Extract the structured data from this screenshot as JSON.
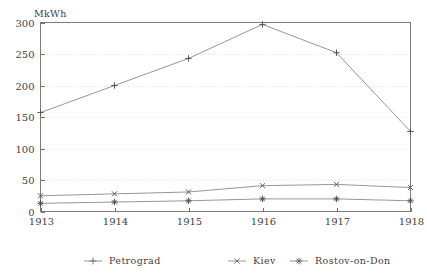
{
  "chart_data": {
    "type": "line",
    "title": "",
    "subtitle": "",
    "xlabel": "",
    "ylabel": "MkWh",
    "y_unit_label": "MkWh",
    "categories": [
      "1913",
      "1914",
      "1915",
      "1916",
      "1917",
      "1918"
    ],
    "x": [
      1913,
      1914,
      1915,
      1916,
      1917,
      1918
    ],
    "xlim": [
      1913,
      1918
    ],
    "ylim": [
      0,
      300
    ],
    "y_ticks": [
      0,
      50,
      100,
      150,
      200,
      250,
      300
    ],
    "y_tick_labels": [
      "0",
      "50",
      "100",
      "150",
      "200",
      "250",
      "300"
    ],
    "x_ticks": [
      1913,
      1914,
      1915,
      1916,
      1917,
      1918
    ],
    "x_tick_labels": [
      "1913",
      "1914",
      "1915",
      "1916",
      "1917",
      "1918"
    ],
    "grid": true,
    "grid_axis": "y",
    "legend_position": "bottom",
    "series": [
      {
        "name": "Petrograd",
        "marker": "plus",
        "values": [
          157,
          200,
          243,
          297,
          252,
          127
        ]
      },
      {
        "name": "Kiev",
        "marker": "cross",
        "values": [
          25,
          28,
          31,
          41,
          43,
          38
        ]
      },
      {
        "name": "Rostov-on-Don",
        "marker": "asterisk",
        "values": [
          13,
          15,
          17,
          20,
          20,
          17
        ]
      }
    ],
    "colors": {
      "line": "#8a8a8a",
      "marker": "#4a4a4a",
      "frame": "#7d7d7d",
      "grid": "#d9d9d9",
      "text": "#3f3f3f",
      "background": "#ffffff"
    }
  },
  "legend": {
    "entries": [
      {
        "label": "Petrograd",
        "marker": "plus"
      },
      {
        "label": "Kiev",
        "marker": "cross"
      },
      {
        "label": "Rostov-on-Don",
        "marker": "asterisk"
      }
    ]
  }
}
